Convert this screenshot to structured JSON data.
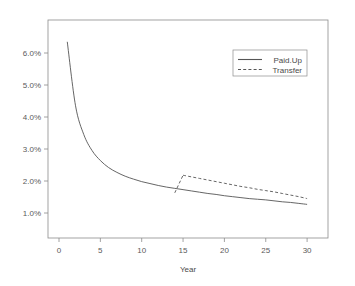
{
  "chart_data": {
    "type": "line",
    "title": "",
    "subtitle": "",
    "xlabel": "Year",
    "ylabel": "",
    "xlim": [
      0,
      31
    ],
    "ylim": [
      0.8,
      6.6
    ],
    "grid": false,
    "legend_position": "top-right",
    "xticks": [
      0,
      5,
      10,
      15,
      20,
      25,
      30
    ],
    "xtick_labels": [
      "0",
      "5",
      "10",
      "15",
      "20",
      "25",
      "30"
    ],
    "yticks": [
      1.0,
      2.0,
      3.0,
      4.0,
      5.0,
      6.0
    ],
    "ytick_labels": [
      "1.0%",
      "2.0%",
      "3.0%",
      "4.0%",
      "5.0%",
      "6.0%"
    ],
    "series": [
      {
        "name": "Paid.Up",
        "style": "solid",
        "color": "#555555",
        "x": [
          1,
          2,
          3,
          4,
          5,
          6,
          7,
          8,
          9,
          10,
          11,
          12,
          13,
          14,
          15,
          16,
          17,
          18,
          19,
          20,
          21,
          22,
          23,
          24,
          25,
          26,
          27,
          28,
          29,
          30
        ],
        "values": [
          6.35,
          4.35,
          3.45,
          2.95,
          2.64,
          2.42,
          2.27,
          2.15,
          2.06,
          1.98,
          1.92,
          1.86,
          1.81,
          1.77,
          1.73,
          1.69,
          1.65,
          1.61,
          1.58,
          1.54,
          1.51,
          1.48,
          1.45,
          1.43,
          1.41,
          1.38,
          1.35,
          1.33,
          1.3,
          1.27
        ]
      },
      {
        "name": "Transfer",
        "style": "dashed",
        "color": "#555555",
        "x": [
          14,
          15,
          16,
          17,
          18,
          19,
          20,
          21,
          22,
          23,
          24,
          25,
          26,
          27,
          28,
          29,
          30
        ],
        "values": [
          1.63,
          2.18,
          2.13,
          2.08,
          2.03,
          1.98,
          1.93,
          1.88,
          1.83,
          1.79,
          1.74,
          1.7,
          1.66,
          1.61,
          1.56,
          1.51,
          1.45
        ]
      }
    ]
  },
  "legend": {
    "entries": [
      {
        "label": "Paid.Up"
      },
      {
        "label": "Transfer"
      }
    ]
  },
  "axes": {
    "x_title": "Year"
  }
}
